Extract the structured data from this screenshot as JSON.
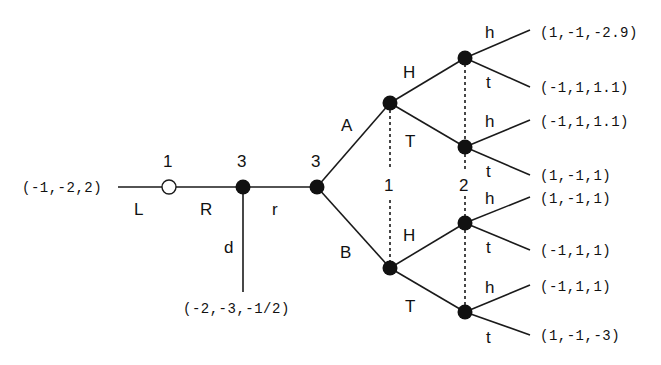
{
  "diagram": {
    "type": "extensive-form game tree",
    "root": {
      "player": "1",
      "kind": "open"
    },
    "nodes": [
      {
        "id": "n_root",
        "player": "1",
        "kind": "open"
      },
      {
        "id": "n_3a",
        "player": "3",
        "kind": "filled"
      },
      {
        "id": "n_3b",
        "player": "3",
        "kind": "filled"
      },
      {
        "id": "n_1top",
        "player": "",
        "kind": "filled"
      },
      {
        "id": "n_1bot",
        "player": "",
        "kind": "filled"
      },
      {
        "id": "n_2a",
        "player": "",
        "kind": "filled"
      },
      {
        "id": "n_2b",
        "player": "",
        "kind": "filled"
      },
      {
        "id": "n_2c",
        "player": "",
        "kind": "filled"
      },
      {
        "id": "n_2d",
        "player": "",
        "kind": "filled"
      }
    ],
    "info_set_labels": {
      "player1": "1",
      "player2": "2"
    },
    "actions": {
      "L": "L",
      "R": "R",
      "r": "r",
      "d": "d",
      "A": "A",
      "B": "B",
      "H_top": "H",
      "T_top": "T",
      "H_bot": "H",
      "T_bot": "T",
      "h1": "h",
      "t1": "t",
      "h2": "h",
      "t2": "t",
      "h3": "h",
      "t3": "t",
      "h4": "h",
      "t4": "t"
    },
    "payoffs": {
      "L": "(-1,-2,2)",
      "d": "(-2,-3,-1/2)",
      "AHh": "(1,-1,-2.9)",
      "AHt": "(-1,1,1.1)",
      "ATh": "(-1,1,1.1)",
      "ATt": "(1,-1,1)",
      "BHh": "(1,-1,1)",
      "BHt": "(-1,1,1)",
      "BTh": "(-1,1,1)",
      "BTt": "(1,-1,-3)"
    }
  }
}
